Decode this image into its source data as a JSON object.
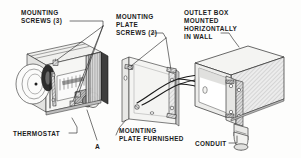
{
  "figure": {
    "background_color": "#fdfdfc",
    "ink_color": "#1b1b1b"
  },
  "labels": {
    "mounting_screws": {
      "line1": "MOUNTING",
      "line2": "SCREWS (3)"
    },
    "mounting_plate_screws": {
      "line1": "MOUNTING",
      "line2": "PLATE",
      "line3": "SCREWS (2)"
    },
    "outlet_box": {
      "line1": "OUTLET BOX",
      "line2": "MOUNTED",
      "line3": "HORIZONTALLY",
      "line4": "IN WALL"
    },
    "thermostat": {
      "line1": "THERMOSTAT"
    },
    "mounting_plate_furnished": {
      "line1": "MOUNTING",
      "line2": "PLATE FURNISHED"
    },
    "conduit": {
      "line1": "CONDUIT"
    },
    "callout_a": {
      "text": "A"
    }
  },
  "parts": {
    "thermostat_body": "thermostat",
    "bimetal_coil": "coiled bimetal element",
    "adjust_knob": "adjustment knob",
    "dark_cover": "thermostat cover plate",
    "mounting_plate": "mounting plate",
    "plate_screw_upper": "upper plate screw",
    "plate_screw_lower": "lower plate screw",
    "outlet_box": "outlet box",
    "box_strap": "mounting strap",
    "conduit_fitting": "conduit",
    "wires": "supply conductors"
  }
}
